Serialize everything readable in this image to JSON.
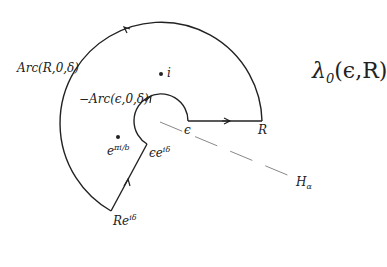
{
  "diagram": {
    "title": "λ",
    "title_sub": "0",
    "title_args": "(ϵ,R)",
    "contour_name": "λ0(ϵ,R)",
    "center": [
      161,
      121
    ],
    "outer_radius": 101,
    "inner_radius": 27,
    "angle_delta_deg": 119,
    "labels": {
      "outer_arc": "Arc(R,0,δ)",
      "inner_arc": "−Arc(ϵ,0,δ)",
      "point_i": "i",
      "point_pole_base": "e",
      "point_pole_exp": "πi/b",
      "inner_end_base": "ϵe",
      "inner_end_exp": "iδ",
      "outer_end_base": "Re",
      "outer_end_exp": "iδ",
      "epsilon": "ϵ",
      "R": "R",
      "halfline_base": "H",
      "halfline_sub": "α"
    },
    "colors": {
      "line": "#222222",
      "dashed": "#888888",
      "background": "#ffffff"
    }
  }
}
